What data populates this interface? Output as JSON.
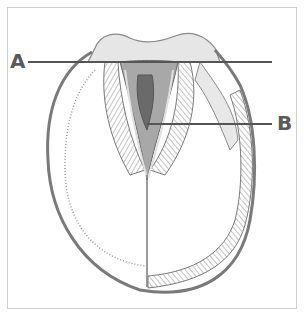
{
  "diagram": {
    "labels": [
      {
        "id": "A",
        "text": "A"
      },
      {
        "id": "B",
        "text": "B"
      }
    ],
    "colors": {
      "frame": "#cfcfcf",
      "leader_line": "#555555",
      "label": "#5a5a5a",
      "sketch_dark": "#6a6a6a",
      "sketch_mid": "#9a9a9a",
      "sketch_light": "#d0d0d0"
    }
  }
}
